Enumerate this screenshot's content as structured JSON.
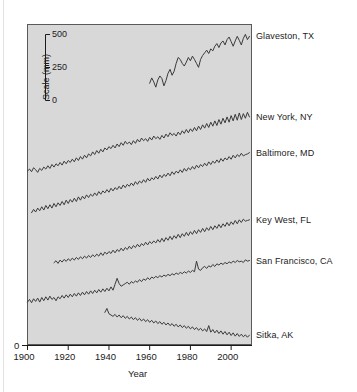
{
  "chart_data": {
    "type": "line",
    "title": "",
    "xlabel": "Year",
    "ylabel": "Scale (mm)",
    "xlim": [
      1900,
      2010
    ],
    "xticks": [
      1900,
      1920,
      1940,
      1960,
      1980,
      2000
    ],
    "xtick_labels": [
      "1900",
      "1920",
      "1940",
      "1960",
      "1980",
      "2000"
    ],
    "origin_label": "0",
    "grid": false,
    "legend_position": "right-of-series",
    "note": "Stacked tide-gauge sea-level records; each series is vertically offset and shares the inset mm scale. Values are relative sea level in mm.",
    "scale_inset": {
      "label": "Scale (mm)",
      "ticks": [
        500,
        250,
        0
      ],
      "tick_labels": [
        "500",
        "250",
        "0"
      ]
    },
    "series": [
      {
        "name": "Glaveston, TX",
        "label": "Glaveston, TX",
        "start_year": 1960,
        "end_year": 2009,
        "trend": "rising",
        "values": [
          150,
          190,
          160,
          120,
          175,
          205,
          185,
          130,
          170,
          225,
          255,
          210,
          240,
          300,
          345,
          330,
          300,
          280,
          310,
          345,
          320,
          355,
          330,
          300,
          270,
          330,
          360,
          380,
          400,
          375,
          410,
          395,
          430,
          450,
          420,
          455,
          470,
          440,
          480,
          500,
          465,
          430,
          470,
          505,
          475,
          440,
          490,
          520,
          480,
          505
        ]
      },
      {
        "name": "New York, NY",
        "label": "New York, NY",
        "start_year": 1900,
        "end_year": 2009,
        "trend": "rising",
        "values": [
          30,
          45,
          25,
          55,
          40,
          20,
          50,
          35,
          60,
          45,
          70,
          50,
          80,
          60,
          85,
          70,
          95,
          75,
          105,
          85,
          110,
          95,
          120,
          100,
          130,
          110,
          140,
          120,
          150,
          130,
          160,
          145,
          175,
          155,
          185,
          165,
          195,
          175,
          205,
          190,
          215,
          200,
          225,
          205,
          235,
          215,
          245,
          225,
          255,
          235,
          250,
          230,
          260,
          240,
          270,
          250,
          280,
          260,
          275,
          255,
          285,
          265,
          295,
          275,
          290,
          270,
          300,
          280,
          310,
          290,
          320,
          300,
          315,
          295,
          325,
          305,
          335,
          315,
          345,
          320,
          350,
          330,
          360,
          335,
          370,
          345,
          380,
          355,
          390,
          360,
          400,
          370,
          410,
          375,
          420,
          385,
          430,
          395,
          440,
          400,
          450,
          410,
          460,
          415,
          470,
          420,
          465,
          430,
          475,
          440
        ]
      },
      {
        "name": "Baltimore, MD",
        "label": "Baltimore, MD",
        "start_year": 1902,
        "end_year": 2009,
        "trend": "rising",
        "values": [
          25,
          50,
          30,
          60,
          40,
          70,
          45,
          80,
          55,
          85,
          60,
          95,
          70,
          100,
          80,
          110,
          85,
          120,
          95,
          125,
          105,
          135,
          110,
          145,
          120,
          150,
          130,
          160,
          140,
          165,
          150,
          175,
          155,
          185,
          165,
          190,
          175,
          200,
          180,
          210,
          190,
          215,
          200,
          225,
          205,
          235,
          215,
          240,
          225,
          250,
          230,
          260,
          240,
          265,
          250,
          275,
          255,
          285,
          265,
          290,
          275,
          300,
          280,
          310,
          290,
          315,
          300,
          325,
          305,
          335,
          315,
          340,
          325,
          350,
          330,
          360,
          340,
          365,
          350,
          375,
          355,
          385,
          365,
          390,
          375,
          400,
          380,
          410,
          390,
          415,
          400,
          425,
          405,
          435,
          415,
          440,
          425,
          450,
          430,
          460,
          440,
          465,
          450,
          475,
          455,
          465,
          470,
          480
        ]
      },
      {
        "name": "Key West, FL",
        "label": "Key West, FL",
        "start_year": 1913,
        "end_year": 2009,
        "trend": "rising",
        "values": [
          40,
          55,
          35,
          60,
          45,
          65,
          50,
          70,
          55,
          75,
          60,
          80,
          65,
          85,
          70,
          90,
          75,
          95,
          80,
          100,
          85,
          105,
          90,
          115,
          95,
          120,
          105,
          125,
          110,
          135,
          115,
          140,
          125,
          150,
          130,
          155,
          140,
          165,
          145,
          170,
          155,
          180,
          160,
          185,
          170,
          195,
          175,
          200,
          185,
          205,
          190,
          215,
          195,
          225,
          200,
          230,
          210,
          240,
          215,
          245,
          225,
          255,
          230,
          260,
          240,
          270,
          245,
          275,
          255,
          285,
          260,
          290,
          270,
          300,
          275,
          305,
          285,
          315,
          290,
          320,
          300,
          330,
          305,
          335,
          315,
          345,
          320,
          350,
          330,
          360,
          335,
          365,
          345,
          370,
          355,
          360,
          365
        ]
      },
      {
        "name": "San Francisco, CA",
        "label": "San Francisco, CA",
        "start_year": 1900,
        "end_year": 2009,
        "trend": "rising",
        "values": [
          60,
          80,
          55,
          85,
          65,
          90,
          60,
          95,
          70,
          100,
          75,
          105,
          80,
          95,
          70,
          100,
          85,
          110,
          90,
          115,
          95,
          120,
          100,
          125,
          105,
          130,
          110,
          135,
          115,
          140,
          120,
          145,
          125,
          150,
          130,
          155,
          135,
          160,
          140,
          165,
          145,
          175,
          150,
          195,
          240,
          200,
          180,
          190,
          200,
          210,
          195,
          215,
          205,
          220,
          210,
          230,
          215,
          235,
          225,
          245,
          230,
          250,
          240,
          255,
          245,
          260,
          250,
          265,
          255,
          270,
          260,
          275,
          265,
          280,
          270,
          285,
          275,
          290,
          280,
          295,
          285,
          300,
          290,
          370,
          310,
          300,
          320,
          330,
          315,
          335,
          325,
          345,
          330,
          350,
          340,
          355,
          345,
          360,
          350,
          365,
          355,
          370,
          360,
          375,
          365,
          370,
          360,
          380,
          370,
          375
        ]
      },
      {
        "name": "Sitka, AK",
        "label": "Sitka, AK",
        "start_year": 1938,
        "end_year": 2009,
        "trend": "falling",
        "values": [
          300,
          330,
          290,
          280,
          270,
          285,
          265,
          280,
          260,
          275,
          255,
          270,
          250,
          265,
          245,
          260,
          240,
          255,
          235,
          250,
          230,
          245,
          225,
          240,
          220,
          235,
          215,
          230,
          210,
          225,
          205,
          220,
          200,
          215,
          195,
          210,
          190,
          205,
          185,
          200,
          180,
          195,
          175,
          190,
          170,
          185,
          165,
          180,
          160,
          175,
          155,
          200,
          150,
          170,
          145,
          165,
          140,
          160,
          135,
          155,
          130,
          150,
          125,
          145,
          120,
          140,
          118,
          135,
          115,
          130,
          112,
          128
        ]
      }
    ]
  }
}
